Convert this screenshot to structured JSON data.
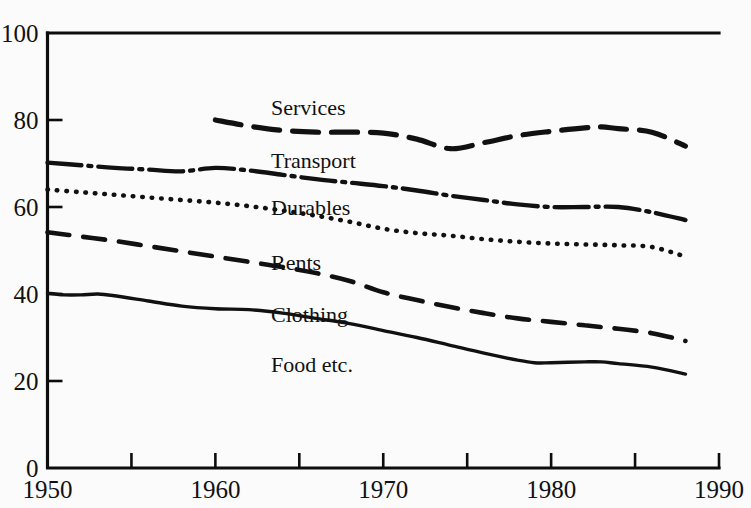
{
  "chart_data": {
    "type": "line",
    "title": "",
    "subtitle": "",
    "xlabel": "",
    "ylabel": "",
    "xlim": [
      1950,
      1990
    ],
    "ylim": [
      0,
      100
    ],
    "grid": false,
    "legend_position": "inline-labels",
    "background_color": "#fbfbfb",
    "line_color": "#111111",
    "x_ticks": [
      1950,
      1955,
      1960,
      1965,
      1970,
      1975,
      1980,
      1985,
      1990
    ],
    "x_tick_labels": [
      "1950",
      "",
      "1960",
      "",
      "1970",
      "",
      "1980",
      "",
      "1990"
    ],
    "y_ticks": [
      0,
      20,
      40,
      60,
      80,
      100
    ],
    "y_tick_labels": [
      "0",
      "20",
      "40",
      "60",
      "80",
      "100"
    ],
    "series": [
      {
        "name": "Services",
        "label": "Services",
        "line_style": "dashed",
        "x": [
          1960,
          1962,
          1964,
          1966,
          1968,
          1970,
          1972,
          1974,
          1976,
          1978,
          1980,
          1982,
          1983,
          1984,
          1986,
          1988
        ],
        "values": [
          80.0,
          78.6,
          77.6,
          77.2,
          77.2,
          77.0,
          75.6,
          73.4,
          74.8,
          76.4,
          77.4,
          78.2,
          78.4,
          78.0,
          77.2,
          74.0
        ]
      },
      {
        "name": "Transport",
        "label": "Transport",
        "line_style": "dash-dot",
        "x": [
          1950,
          1952,
          1954,
          1956,
          1958,
          1960,
          1962,
          1964,
          1966,
          1968,
          1970,
          1972,
          1974,
          1976,
          1978,
          1980,
          1982,
          1984,
          1986,
          1988
        ],
        "values": [
          70.2,
          69.6,
          69.0,
          68.6,
          68.2,
          69.0,
          68.4,
          67.4,
          66.4,
          65.6,
          64.8,
          63.8,
          62.6,
          61.6,
          60.6,
          60.0,
          60.0,
          60.0,
          58.8,
          57.0
        ]
      },
      {
        "name": "Durables",
        "label": "Durables",
        "line_style": "dotted",
        "x": [
          1950,
          1952,
          1954,
          1956,
          1958,
          1960,
          1962,
          1964,
          1966,
          1968,
          1970,
          1972,
          1974,
          1976,
          1978,
          1980,
          1982,
          1984,
          1986,
          1988
        ],
        "values": [
          64.0,
          63.4,
          62.8,
          62.2,
          61.6,
          61.0,
          60.2,
          59.2,
          58.0,
          56.6,
          55.0,
          54.0,
          53.4,
          52.6,
          52.0,
          51.6,
          51.4,
          51.2,
          50.8,
          48.6
        ]
      },
      {
        "name": "Rents",
        "label": "Rents",
        "line_style": "long-dashed",
        "x": [
          1950,
          1952,
          1954,
          1956,
          1958,
          1960,
          1962,
          1964,
          1966,
          1968,
          1970,
          1972,
          1974,
          1976,
          1978,
          1980,
          1982,
          1984,
          1986,
          1988
        ],
        "values": [
          54.2,
          53.2,
          52.2,
          51.0,
          49.8,
          48.6,
          47.4,
          46.2,
          44.8,
          43.0,
          40.4,
          38.6,
          37.0,
          35.6,
          34.4,
          33.6,
          32.8,
          32.0,
          31.0,
          29.2
        ]
      },
      {
        "name": "Clothing",
        "label": "Clothing",
        "line_style": "none",
        "x": [],
        "values": []
      },
      {
        "name": "Food etc.",
        "label": "Food etc.",
        "line_style": "solid",
        "x": [
          1950,
          1951,
          1952,
          1953,
          1954,
          1956,
          1958,
          1960,
          1962,
          1964,
          1966,
          1968,
          1970,
          1972,
          1974,
          1976,
          1978,
          1979,
          1980,
          1982,
          1983,
          1984,
          1986,
          1988
        ],
        "values": [
          40.2,
          39.8,
          39.8,
          40.0,
          39.6,
          38.4,
          37.2,
          36.6,
          36.4,
          35.6,
          34.4,
          33.2,
          31.6,
          30.0,
          28.2,
          26.4,
          24.8,
          24.2,
          24.2,
          24.4,
          24.4,
          24.0,
          23.2,
          21.6
        ]
      }
    ],
    "inline_labels": [
      {
        "text": "Services",
        "x_px": 271,
        "y_px": 115
      },
      {
        "text": "Transport",
        "x_px": 271,
        "y_px": 168
      },
      {
        "text": "Durables",
        "x_px": 271,
        "y_px": 215
      },
      {
        "text": "Rents",
        "x_px": 271,
        "y_px": 270
      },
      {
        "text": "Clothing",
        "x_px": 271,
        "y_px": 322
      },
      {
        "text": "Food etc.",
        "x_px": 271,
        "y_px": 372
      }
    ]
  }
}
